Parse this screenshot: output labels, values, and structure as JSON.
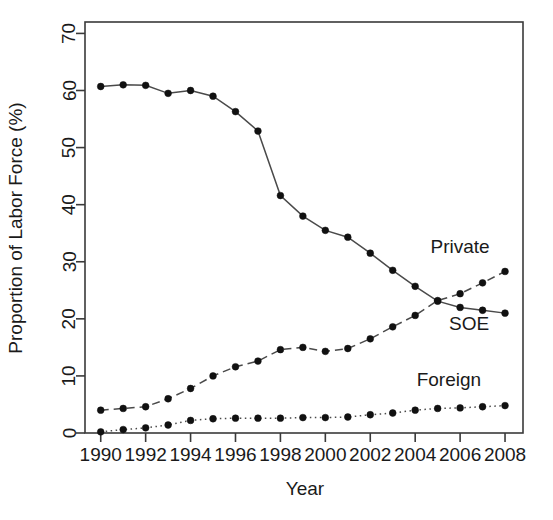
{
  "chart_data": {
    "type": "line",
    "title": "",
    "xlabel": "Year",
    "ylabel": "Proportion of Labor Force (%)",
    "xlim": [
      1989.3,
      2008.8
    ],
    "ylim": [
      0,
      72
    ],
    "grid": false,
    "legend_position": "inline-annotations",
    "x": [
      1990,
      1991,
      1992,
      1993,
      1994,
      1995,
      1996,
      1997,
      1998,
      1999,
      2000,
      2001,
      2002,
      2003,
      2004,
      2005,
      2006,
      2007,
      2008
    ],
    "xticks": [
      1990,
      1992,
      1994,
      1996,
      1998,
      2000,
      2002,
      2004,
      2006,
      2008
    ],
    "xtick_labels": [
      "1990",
      "1992",
      "1994",
      "1996",
      "1998",
      "2000",
      "2002",
      "2004",
      "2006",
      "2008"
    ],
    "yticks": [
      0,
      10,
      20,
      30,
      40,
      50,
      60,
      70
    ],
    "ytick_labels": [
      "0",
      "10",
      "20",
      "30",
      "40",
      "50",
      "60",
      "70"
    ],
    "series": [
      {
        "name": "SOE",
        "label": "SOE",
        "linestyle": "solid",
        "color": "#4a4a4a",
        "marker": "filled-circle",
        "values": [
          60.7,
          61.0,
          60.9,
          59.5,
          60.0,
          59.0,
          56.3,
          52.9,
          41.6,
          38.0,
          35.5,
          34.3,
          31.5,
          28.5,
          25.7,
          23.1,
          22.0,
          21.5,
          21.0
        ]
      },
      {
        "name": "Private",
        "label": "Private",
        "linestyle": "dashed",
        "color": "#4a4a4a",
        "marker": "filled-circle",
        "values": [
          4.0,
          4.3,
          4.6,
          6.0,
          7.8,
          10.0,
          11.6,
          12.6,
          14.6,
          15.0,
          14.3,
          14.8,
          16.5,
          18.6,
          20.6,
          23.2,
          24.4,
          26.3,
          28.3
        ]
      },
      {
        "name": "Foreign",
        "label": "Foreign",
        "linestyle": "dotted",
        "color": "#4a4a4a",
        "marker": "filled-circle",
        "values": [
          0.2,
          0.6,
          0.9,
          1.4,
          2.2,
          2.5,
          2.6,
          2.6,
          2.6,
          2.7,
          2.7,
          2.8,
          3.2,
          3.5,
          4.0,
          4.3,
          4.4,
          4.6,
          4.8
        ]
      }
    ],
    "annotations": [
      {
        "text": "Private",
        "x": 2006.0,
        "y": 31.5
      },
      {
        "text": "SOE",
        "x": 2006.4,
        "y": 18.0
      },
      {
        "text": "Foreign",
        "x": 2005.5,
        "y": 8.2
      }
    ]
  }
}
